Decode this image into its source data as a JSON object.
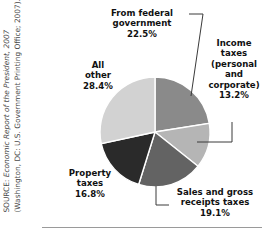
{
  "figure": {
    "background_color": "#ffffff",
    "width": 277,
    "height": 238
  },
  "source_note": {
    "prefix": "SOURCE: ",
    "italic_part": "Economic Report of the President, 2007",
    "suffix": " (Washington, DC: U.S. Government Printing Office; 2007)."
  },
  "labels": {
    "federal": "From federal\ngovernment\n22.5%",
    "income": "Income\ntaxes\n(personal\nand\ncorporate)\n13.2%",
    "all_other": "All\nother\n28.4%",
    "property": "Property\ntaxes\n16.8%",
    "sales": "Sales and gross\nreceipts taxes\n19.1%"
  },
  "chart_data": {
    "type": "pie",
    "title": "",
    "subtitle": "",
    "xlabel": "",
    "ylabel": "",
    "legend_position": "none",
    "grid": false,
    "units": "percent",
    "start_angle_deg": 0,
    "direction": "clockwise",
    "center": {
      "x": 155,
      "y": 132
    },
    "radius": 55,
    "categories": [
      "From federal government",
      "Income taxes (personal and corporate)",
      "Sales and gross receipts taxes",
      "Property taxes",
      "All other"
    ],
    "values": [
      22.5,
      13.2,
      19.1,
      16.8,
      28.4
    ],
    "value_labels": [
      "22.5%",
      "13.2%",
      "19.1%",
      "16.8%",
      "28.4%"
    ],
    "colors": [
      "#8a8a8a",
      "#b5b5b5",
      "#636363",
      "#2a2a2a",
      "#d2d2d2"
    ],
    "slice_border_color": "#ffffff",
    "total": 100.0
  }
}
